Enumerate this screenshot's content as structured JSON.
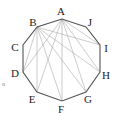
{
  "diagram": {
    "type": "decagon-with-diagonals",
    "vertices": [
      {
        "label": "A",
        "x": 62,
        "y": 19,
        "lx": 61,
        "ly": 15
      },
      {
        "label": "B",
        "x": 37,
        "y": 27,
        "lx": 33,
        "ly": 26
      },
      {
        "label": "C",
        "x": 23,
        "y": 45,
        "lx": 15,
        "ly": 51
      },
      {
        "label": "D",
        "x": 23,
        "y": 72,
        "lx": 15,
        "ly": 77
      },
      {
        "label": "E",
        "x": 37,
        "y": 92,
        "lx": 32,
        "ly": 103
      },
      {
        "label": "F",
        "x": 62,
        "y": 101,
        "lx": 61,
        "ly": 113
      },
      {
        "label": "G",
        "x": 86,
        "y": 92,
        "lx": 88,
        "ly": 103
      },
      {
        "label": "H",
        "x": 100,
        "y": 72,
        "lx": 106,
        "ly": 79
      },
      {
        "label": "I",
        "x": 100,
        "y": 45,
        "lx": 106,
        "ly": 52
      },
      {
        "label": "J",
        "x": 86,
        "y": 27,
        "lx": 90,
        "ly": 26
      }
    ],
    "diagonals": [
      [
        "A",
        "D"
      ],
      [
        "A",
        "E"
      ],
      [
        "A",
        "F"
      ],
      [
        "A",
        "G"
      ],
      [
        "A",
        "H"
      ],
      [
        "A",
        "I"
      ],
      [
        "B",
        "D"
      ],
      [
        "B",
        "E"
      ],
      [
        "B",
        "F"
      ],
      [
        "B",
        "G"
      ],
      [
        "B",
        "H"
      ],
      [
        "B",
        "I"
      ]
    ],
    "side_mark": {
      "text": "o",
      "x": 2,
      "y": 86
    },
    "colors": {
      "edge": "#555555",
      "diagonal": "#aaaaaa",
      "label": "#222222"
    }
  }
}
